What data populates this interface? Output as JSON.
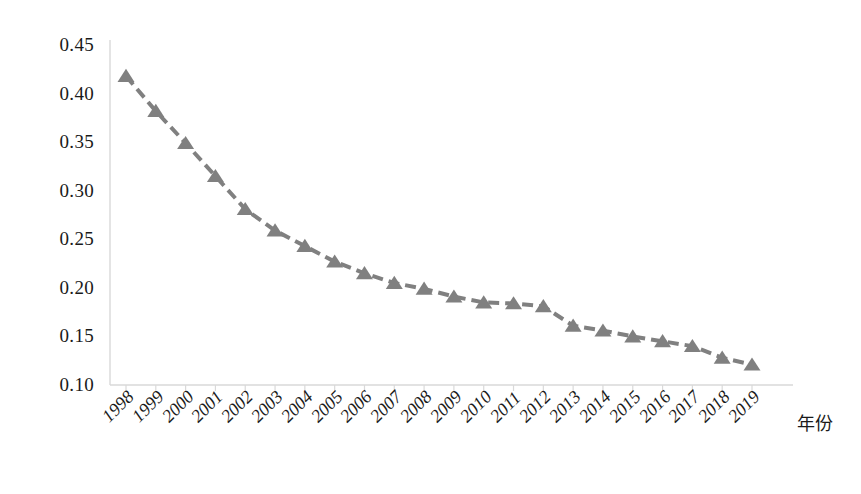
{
  "chart_data": {
    "type": "line",
    "title": "",
    "xlabel": "年份",
    "ylabel": "",
    "categories": [
      "1998",
      "1999",
      "2000",
      "2001",
      "2002",
      "2003",
      "2004",
      "2005",
      "2006",
      "2007",
      "2008",
      "2009",
      "2010",
      "2011",
      "2012",
      "2013",
      "2014",
      "2015",
      "2016",
      "2017",
      "2018",
      "2019"
    ],
    "values": [
      0.418,
      0.382,
      0.349,
      0.315,
      0.281,
      0.259,
      0.243,
      0.227,
      0.215,
      0.205,
      0.199,
      0.191,
      0.185,
      0.184,
      0.181,
      0.161,
      0.156,
      0.15,
      0.145,
      0.14,
      0.128,
      0.121
    ],
    "ylim": [
      0.1,
      0.45
    ],
    "ytick_labels": [
      "0.45",
      "0.40",
      "0.35",
      "0.30",
      "0.25",
      "0.20",
      "0.15",
      "0.10"
    ],
    "ytick_values": [
      0.45,
      0.4,
      0.35,
      0.3,
      0.25,
      0.2,
      0.15,
      0.1
    ],
    "grid": false,
    "legend": null,
    "series_color": "#808080",
    "line_style": "dashed",
    "marker": "triangle",
    "axis_color": "#d9d9d9"
  }
}
